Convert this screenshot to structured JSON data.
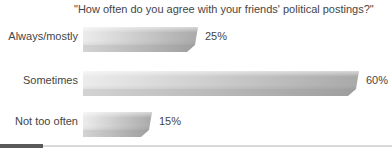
{
  "chart_data": {
    "type": "bar",
    "orientation": "horizontal",
    "title": "\"How often do you agree with your friends' political postings?\"",
    "categories": [
      "Always/mostly",
      "Sometimes",
      "Not too often"
    ],
    "values": [
      25,
      60,
      15
    ],
    "value_labels": [
      "25%",
      "60%",
      "15%"
    ],
    "unit": "percent",
    "xlim": [
      0,
      65
    ],
    "grid": false,
    "legend": false,
    "axis_labels_visible": false,
    "bar_face_gradient": [
      "#ececec",
      "#a9a9a9"
    ],
    "bar_bevel_gradient": [
      "#d3d3d3",
      "#9d9d9d"
    ],
    "text_color": "#454545"
  },
  "footer": {
    "divider_color": "#d9d9d9",
    "accent_color": "#595959"
  }
}
